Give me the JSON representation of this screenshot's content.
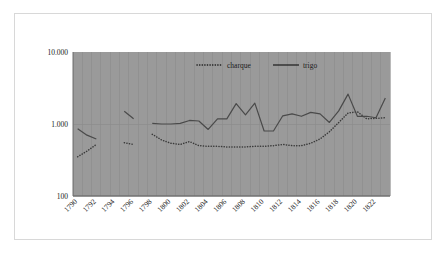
{
  "chart_data": {
    "type": "line",
    "title": "",
    "subtitle": "",
    "xlabel": "",
    "ylabel": "",
    "yscale": "log",
    "ylim": [
      0.1,
      10.0
    ],
    "grid": true,
    "grid_axis": "both",
    "legend_position": "top-center",
    "ytick_labels": [
      "10.000",
      "1.000",
      "100"
    ],
    "ytick_values": [
      10.0,
      1.0,
      0.1
    ],
    "xtick_labels": [
      "1790",
      "1792",
      "1794",
      "1796",
      "1798",
      "1800",
      "1802",
      "1804",
      "1806",
      "1808",
      "1810",
      "1812",
      "1814",
      "1816",
      "1818",
      "1820",
      "1822"
    ],
    "x": [
      1790,
      1791,
      1792,
      1793,
      1794,
      1795,
      1796,
      1797,
      1798,
      1799,
      1800,
      1801,
      1802,
      1803,
      1804,
      1805,
      1806,
      1807,
      1808,
      1809,
      1810,
      1811,
      1812,
      1813,
      1814,
      1815,
      1816,
      1817,
      1818,
      1819,
      1820,
      1821,
      1822,
      1823
    ],
    "series": [
      {
        "name": "charque",
        "style": "dotted",
        "color": "#3a3a3a",
        "values": [
          0.35,
          0.42,
          0.52,
          null,
          null,
          0.55,
          0.52,
          null,
          0.72,
          0.6,
          0.54,
          0.52,
          0.57,
          0.5,
          0.49,
          0.49,
          0.48,
          0.48,
          0.48,
          0.49,
          0.49,
          0.5,
          0.52,
          0.5,
          0.5,
          0.54,
          0.62,
          0.78,
          1.05,
          1.42,
          1.48,
          1.18,
          1.2,
          1.22
        ]
      },
      {
        "name": "trigo",
        "style": "solid",
        "color": "#4a4a4a",
        "values": [
          0.86,
          0.7,
          0.62,
          null,
          null,
          1.5,
          1.18,
          null,
          1.02,
          1.0,
          1.0,
          1.02,
          1.12,
          1.1,
          0.84,
          1.18,
          1.18,
          1.92,
          1.34,
          1.95,
          0.8,
          0.8,
          1.3,
          1.38,
          1.28,
          1.45,
          1.38,
          1.05,
          1.52,
          2.6,
          1.28,
          1.28,
          1.22,
          2.3
        ]
      }
    ],
    "legend": [
      {
        "label": "charque",
        "style": "dotted"
      },
      {
        "label": "trigo",
        "style": "solid"
      }
    ]
  },
  "colors": {
    "plot_background": "#9a9a9a",
    "canvas_background": "#ffffff",
    "gridline": "#8c8c8c",
    "axis_line": "#707070",
    "frame_border": "#d8d8d8",
    "text": "#1a1a1a"
  }
}
